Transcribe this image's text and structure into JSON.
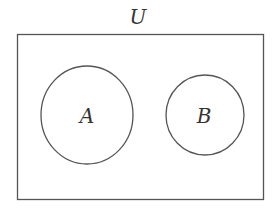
{
  "diagram": {
    "type": "venn",
    "universe": {
      "label": "U"
    },
    "sets": [
      {
        "label": "A"
      },
      {
        "label": "B"
      }
    ],
    "colors": {
      "stroke": "#555555",
      "text": "#333333",
      "background": "#ffffff"
    }
  }
}
